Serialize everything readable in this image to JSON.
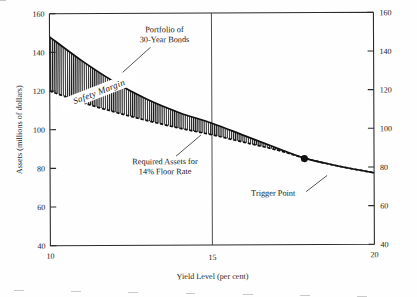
{
  "chart_data": {
    "type": "area",
    "title": "",
    "xlabel": "Yield Level (per cent)",
    "ylabel": "Assets (millions of dollars)",
    "xlim": [
      10,
      20
    ],
    "ylim": [
      40,
      160
    ],
    "xticks": [
      10,
      15,
      20
    ],
    "xticklabels": [
      "10",
      "15",
      "20"
    ],
    "yticks": [
      40,
      60,
      80,
      100,
      120,
      140,
      160
    ],
    "yticklabels_left": [
      "40",
      "60",
      "80",
      "100",
      "120",
      "140",
      "160"
    ],
    "yticklabels_right": [
      "40",
      "60",
      "80",
      "100",
      "120",
      "140",
      "160"
    ],
    "grid": false,
    "gridlines_x": [
      15
    ],
    "legend": "none",
    "series": [
      {
        "name": "Portfolio of 30-Year Bonds",
        "style": "solid",
        "x": [
          10,
          11,
          12,
          13,
          14,
          15,
          16,
          17,
          17.8,
          18.5,
          19.2,
          20
        ],
        "values": [
          148,
          135.5,
          124.5,
          115.5,
          108.5,
          103,
          96.5,
          90,
          85,
          82,
          79.5,
          77
        ]
      },
      {
        "name": "Required Assets for 14% Floor Rate",
        "style": "dashed",
        "x": [
          10,
          11,
          12,
          13,
          14,
          15,
          16,
          17,
          17.8,
          18.5,
          19.2,
          20
        ],
        "values": [
          120,
          114,
          109,
          104.5,
          100.5,
          97,
          93,
          89,
          85,
          82,
          79.5,
          77
        ]
      }
    ],
    "band": {
      "name": "Safety Margin",
      "label": "Safety Margin",
      "fill": "vertical-hatch",
      "between": [
        "Portfolio of 30-Year Bonds",
        "Required Assets for 14% Floor Rate"
      ]
    },
    "annotations": [
      {
        "id": "portfolio",
        "lines": [
          "Portfolio of",
          "30-Year Bonds"
        ],
        "target_x": 13.1,
        "target_y": 114.5
      },
      {
        "id": "required",
        "lines": [
          "Required Assets for",
          "14% Floor Rate"
        ],
        "target_x": 14.6,
        "target_y": 99.5
      },
      {
        "id": "trigger",
        "lines": [
          "Trigger Point"
        ],
        "target_x": 17.85,
        "target_y": 84.5
      }
    ],
    "points": [
      {
        "name": "Trigger Point",
        "x": 17.85,
        "y": 84.5,
        "marker": "filled-circle"
      }
    ],
    "colors": {
      "axis": "#2b2b2b",
      "curve": "#111111",
      "hatch": "#1b1b1b",
      "background": "#fefefe"
    }
  },
  "labels": {
    "y_axis_title": "Assets (millions of dollars)",
    "x_axis_title": "Yield Level (per cent)",
    "band_label": "Safety Margin",
    "annot_portfolio_l1": "Portfolio of",
    "annot_portfolio_l2": "30-Year Bonds",
    "annot_required_l1": "Required Assets for",
    "annot_required_l2": "14% Floor Rate",
    "annot_trigger": "Trigger Point",
    "y_160": "160",
    "y_140": "140",
    "y_120": "120",
    "y_100": "100",
    "y_80": "80",
    "y_60": "60",
    "y_40": "40",
    "x_10": "10",
    "x_15": "15",
    "x_20": "20"
  }
}
